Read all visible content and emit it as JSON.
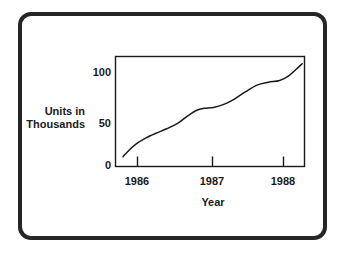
{
  "figure": {
    "border_color": "#262626",
    "background": "#ffffff",
    "axis_color": "#1a1a1a",
    "line_color": "#1a1a1a"
  },
  "axes": {
    "ylabel_line1": "Units in",
    "ylabel_line2": "Thousands",
    "xlabel": "Year",
    "ytick_labels": [
      "100",
      "50",
      "0"
    ],
    "xtick_labels": [
      "1986",
      "1987",
      "1988"
    ]
  },
  "chart_data": {
    "type": "line",
    "title": "",
    "xlabel": "Year",
    "ylabel": "Units in Thousands",
    "xlim": [
      1985.82,
      1988.33
    ],
    "ylim": [
      0,
      115
    ],
    "yticks": [
      0,
      50,
      100
    ],
    "ytick_labels": [
      "0",
      "50",
      "100"
    ],
    "xticks": [
      1986,
      1987,
      1988
    ],
    "xtick_labels": [
      "1986",
      "1987",
      "1988"
    ],
    "grid": false,
    "legend": false,
    "series": [
      {
        "name": "Units sold",
        "x": [
          1985.92,
          1986.0,
          1986.1,
          1986.22,
          1986.35,
          1986.5,
          1986.65,
          1986.78,
          1986.9,
          1987.0,
          1987.12,
          1987.25,
          1987.4,
          1987.55,
          1987.7,
          1987.85,
          1988.0,
          1988.12,
          1988.22,
          1988.3
        ],
        "values": [
          10,
          17,
          24,
          30,
          35,
          40,
          46,
          54,
          60,
          62,
          63,
          66,
          72,
          80,
          87,
          90,
          92,
          97,
          104,
          110
        ]
      }
    ]
  }
}
